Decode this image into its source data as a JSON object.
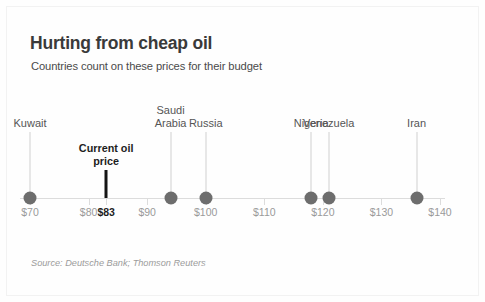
{
  "chart_data": {
    "type": "scatter",
    "title": "Hurting from cheap oil",
    "subtitle": "Countries count on these prices for their budget",
    "xlabel": "",
    "ylabel": "",
    "xlim": [
      65,
      144
    ],
    "grid": false,
    "legend": "none",
    "orientation": "horizontal-number-line",
    "unit": "USD per barrel",
    "categories": [
      "Kuwait",
      "Saudi Arabia",
      "Russia",
      "Nigeria",
      "Venezuela",
      "Iran"
    ],
    "values": [
      70,
      94,
      100,
      118,
      121,
      136
    ],
    "points": [
      {
        "label": "Kuwait",
        "label_lines": [
          "Kuwait"
        ],
        "value": 70,
        "leader_height": 60
      },
      {
        "label": "Saudi Arabia",
        "label_lines": [
          "Saudi",
          "Arabia"
        ],
        "value": 94,
        "leader_height": 60
      },
      {
        "label": "Russia",
        "label_lines": [
          "Russia"
        ],
        "value": 100,
        "leader_height": 60
      },
      {
        "label": "Nigeria",
        "label_lines": [
          "Nigeria"
        ],
        "value": 118,
        "leader_height": 60
      },
      {
        "label": "Venezuela",
        "label_lines": [
          "Venezuela"
        ],
        "value": 121,
        "leader_height": 60
      },
      {
        "label": "Iran",
        "label_lines": [
          "Iran"
        ],
        "value": 136,
        "leader_height": 60
      }
    ],
    "annotation": {
      "label_lines": [
        "Current oil",
        "price"
      ],
      "label": "Current oil price",
      "value": 83,
      "tick_label": "$83"
    },
    "ticks": [
      {
        "value": 70,
        "label": "$70",
        "current": false
      },
      {
        "value": 80,
        "label": "$80",
        "current": false
      },
      {
        "value": 83,
        "label": "$83",
        "current": true
      },
      {
        "value": 90,
        "label": "$90",
        "current": false
      },
      {
        "value": 100,
        "label": "$100",
        "current": false
      },
      {
        "value": 110,
        "label": "$110",
        "current": false
      },
      {
        "value": 120,
        "label": "$120",
        "current": false
      },
      {
        "value": 130,
        "label": "$130",
        "current": false
      },
      {
        "value": 140,
        "label": "$140",
        "current": false
      }
    ],
    "source": "Source: Deutsche Bank; Thomson Reuters",
    "colors": {
      "dot": "#6d6d6d",
      "axis": "#dcdcdc",
      "tick_text": "#9a9a9a",
      "current_marker": "#141414",
      "title_text": "#3a3a3a",
      "label_text": "#555555",
      "source_text": "#9c9c9c",
      "background": "#fefefe"
    }
  }
}
